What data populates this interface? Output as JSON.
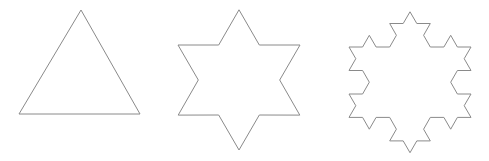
{
  "figure": {
    "title": "",
    "stroke_color": "#8a8a8a",
    "background": "#ffffff",
    "shapes": [
      {
        "name": "koch-iteration-0",
        "label": "",
        "kind": "triangle",
        "level": 0
      },
      {
        "name": "koch-iteration-1",
        "label": "",
        "kind": "hexagram",
        "level": 1
      },
      {
        "name": "koch-iteration-2",
        "label": "",
        "kind": "koch-snowflake",
        "level": 2
      }
    ]
  }
}
